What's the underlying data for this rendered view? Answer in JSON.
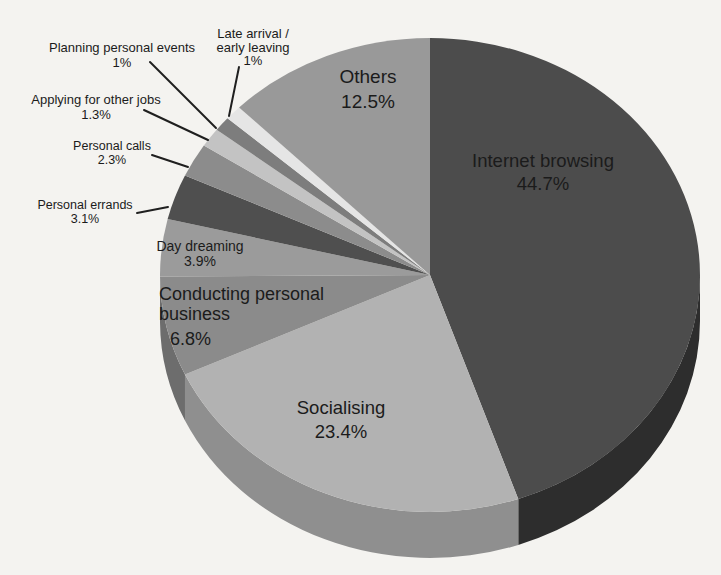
{
  "page": {
    "background": "#f4f3f0",
    "text_color": "#1b1b1b",
    "leader_line_color": "#1f1f1f"
  },
  "chart_data": {
    "type": "pie",
    "style": "3d",
    "title": "",
    "unit": "percent",
    "direction": "clockwise",
    "start_angle_deg": 0,
    "total": 100,
    "legend": "none",
    "slices": [
      {
        "name": "internet-browsing",
        "label": "Internet browsing",
        "value": 44.7,
        "display": "44.7%",
        "color": "#4c4c4c",
        "side_color": "#2d2d2d"
      },
      {
        "name": "socialising",
        "label": "Socialising",
        "value": 23.4,
        "display": "23.4%",
        "color": "#b2b2b2",
        "side_color": "#8f8f8f"
      },
      {
        "name": "conducting-personal-business",
        "label": "Conducting personal business",
        "value": 6.8,
        "display": "6.8%",
        "color": "#8b8b8b",
        "side_color": "#6d6d6d"
      },
      {
        "name": "day-dreaming",
        "label": "Day dreaming",
        "value": 3.9,
        "display": "3.9%",
        "color": "#9b9b9b",
        "side_color": "#787878"
      },
      {
        "name": "personal-errands",
        "label": "Personal errands",
        "value": 3.1,
        "display": "3.1%",
        "color": "#4f4f4f",
        "side_color": "#323232"
      },
      {
        "name": "personal-calls",
        "label": "Personal calls",
        "value": 2.3,
        "display": "2.3%",
        "color": "#8c8c8c",
        "side_color": "#6f6f6f"
      },
      {
        "name": "applying-for-other-jobs",
        "label": "Applying for other jobs",
        "value": 1.3,
        "display": "1.3%",
        "color": "#c3c3c3",
        "side_color": "#9f9f9f"
      },
      {
        "name": "planning-personal-events",
        "label": "Planning personal events",
        "value": 1,
        "display": "1%",
        "color": "#7d7d7d",
        "side_color": "#5e5e5e"
      },
      {
        "name": "late-arrival-early-leaving",
        "label": "Late arrival / early leaving",
        "value": 1,
        "display": "1%",
        "color": "#e5e5e5",
        "side_color": "#c4c4c4"
      },
      {
        "name": "others",
        "label": "Others",
        "value": 12.5,
        "display": "12.5%",
        "color": "#999999",
        "side_color": "#7a7a7a"
      }
    ],
    "geometry": {
      "width": 721,
      "height": 575,
      "cx": 430,
      "cy": 275,
      "rx": 270,
      "ry": 237,
      "depth": 46
    },
    "labels": [
      {
        "name": "label-planning-personal-events",
        "x": 122,
        "y": 40,
        "align": "center",
        "size": 13,
        "lh": 15,
        "lines": [
          "Planning personal events",
          "1%"
        ]
      },
      {
        "name": "label-late-arrival-early-leaving",
        "x": 253,
        "y": 27,
        "align": "center",
        "size": 13,
        "lh": 13.5,
        "lines": [
          "Late arrival /",
          "early leaving",
          "1%"
        ]
      },
      {
        "name": "label-applying-for-other-jobs",
        "x": 96,
        "y": 92,
        "align": "center",
        "size": 13,
        "lh": 15,
        "lines": [
          "Applying for other jobs",
          "1.3%"
        ]
      },
      {
        "name": "label-personal-calls",
        "x": 112,
        "y": 140,
        "align": "center",
        "size": 12.5,
        "lh": 13.5,
        "lines": [
          "Personal calls",
          "2.3%"
        ]
      },
      {
        "name": "label-personal-errands",
        "x": 85,
        "y": 199,
        "align": "center",
        "size": 12.5,
        "lh": 13.5,
        "lines": [
          "Personal errands",
          "3.1%"
        ]
      },
      {
        "name": "label-day-dreaming",
        "x": 200,
        "y": 239,
        "align": "center",
        "size": 14,
        "lh": 14.5,
        "lines": [
          "Day dreaming",
          "3.9%"
        ]
      },
      {
        "name": "label-conducting-personal-business",
        "x": 159,
        "y": 284,
        "align": "left",
        "size": 18,
        "lh": 20,
        "lines": [
          "Conducting personal",
          "business"
        ]
      },
      {
        "name": "label-conducting-personal-business-pct",
        "x": 170,
        "y": 329,
        "align": "left",
        "size": 18,
        "lh": 20,
        "lines": [
          "6.8%"
        ]
      },
      {
        "name": "label-socialising",
        "x": 341,
        "y": 396,
        "align": "center",
        "size": 18.5,
        "lh": 24,
        "lines": [
          "Socialising",
          "23.4%"
        ]
      },
      {
        "name": "label-internet-browsing",
        "x": 543,
        "y": 149,
        "align": "center",
        "size": 18.5,
        "lh": 23,
        "lines": [
          "Internet browsing",
          "44.7%"
        ]
      },
      {
        "name": "label-others",
        "x": 368,
        "y": 65,
        "align": "center",
        "size": 19,
        "lh": 24.5,
        "lines": [
          "Others",
          "12.5%"
        ]
      }
    ],
    "leader_lines": [
      {
        "name": "leader-planning-personal-events",
        "x1": 150,
        "y1": 62,
        "x2": 216,
        "y2": 128
      },
      {
        "name": "leader-late-arrival-early-leaving",
        "x1": 239,
        "y1": 67,
        "x2": 229,
        "y2": 116
      },
      {
        "name": "leader-applying-for-other-jobs",
        "x1": 144,
        "y1": 110,
        "x2": 208,
        "y2": 140
      },
      {
        "name": "leader-personal-calls",
        "x1": 152,
        "y1": 155,
        "x2": 188,
        "y2": 167
      },
      {
        "name": "leader-personal-errands",
        "x1": 137,
        "y1": 213,
        "x2": 168,
        "y2": 207
      }
    ]
  }
}
